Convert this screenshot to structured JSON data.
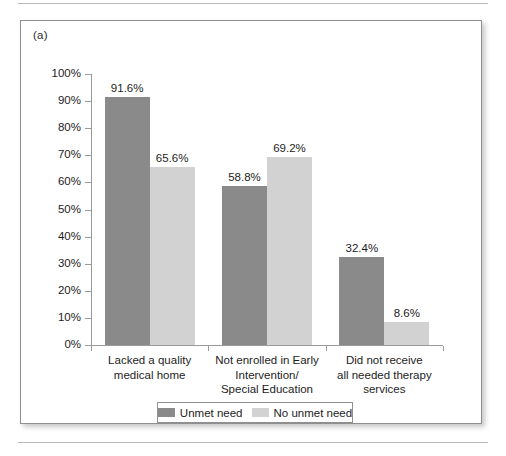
{
  "figure": {
    "panel_label": "(a)"
  },
  "chart_data": {
    "type": "bar",
    "title": "",
    "xlabel": "",
    "ylabel": "",
    "ylim": [
      0,
      100
    ],
    "grid": false,
    "legend_position": "bottom",
    "ytick_labels": [
      "0%",
      "10%",
      "20%",
      "30%",
      "40%",
      "50%",
      "60%",
      "70%",
      "80%",
      "90%",
      "100%"
    ],
    "ytick_values": [
      0,
      10,
      20,
      30,
      40,
      50,
      60,
      70,
      80,
      90,
      100
    ],
    "categories": [
      "Lacked a quality\nmedical home",
      "Not enrolled in Early\nIntervention/\nSpecial Education",
      "Did not receive\nall needed therapy\nservices"
    ],
    "category_lines": [
      [
        "Lacked a quality",
        "medical home"
      ],
      [
        "Not enrolled in Early",
        "Intervention/",
        "Special Education"
      ],
      [
        "Did not receive",
        "all needed therapy",
        "services"
      ]
    ],
    "series": [
      {
        "name": "Unmet need",
        "color": "#8a8a8a",
        "values": [
          91.6,
          58.8,
          32.4
        ],
        "labels": [
          "91.6%",
          "58.8%",
          "32.4%"
        ]
      },
      {
        "name": "No unmet need",
        "color": "#d2d2d2",
        "values": [
          65.6,
          69.2,
          8.6
        ],
        "labels": [
          "65.6%",
          "69.2%",
          "8.6%"
        ]
      }
    ]
  },
  "legend": {
    "entries": [
      {
        "label": "Unmet need",
        "color": "#8a8a8a"
      },
      {
        "label": "No unmet need",
        "color": "#d2d2d2"
      }
    ]
  }
}
